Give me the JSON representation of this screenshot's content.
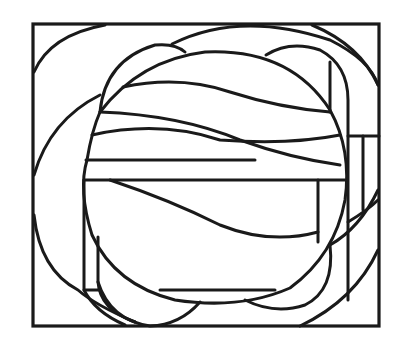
{
  "artwork": {
    "type": "line-art",
    "subject": "abstract geometric composition with circle, arcs and bands inside rectangular frame",
    "colors": {
      "stroke": "#1a1a1a",
      "background": "#ffffff"
    }
  }
}
